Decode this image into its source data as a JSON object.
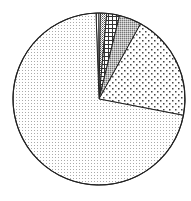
{
  "chart_data": {
    "type": "pie",
    "title": "",
    "legend": "none",
    "labels": [],
    "start_angle_deg": -2,
    "direction": "clockwise",
    "center": [
      99,
      99
    ],
    "radius": 86,
    "slices": [
      {
        "name": "slice-1",
        "pattern": "vertical-lines",
        "value": 0.8
      },
      {
        "name": "slice-2",
        "pattern": "checker-dots",
        "value": 1.2
      },
      {
        "name": "slice-3",
        "pattern": "grid",
        "value": 2.4
      },
      {
        "name": "slice-4",
        "pattern": "dense-stipple",
        "value": 4.2
      },
      {
        "name": "slice-5",
        "pattern": "sparse-dots",
        "value": 20.0
      },
      {
        "name": "slice-6",
        "pattern": "fine-dots",
        "value": 71.4
      }
    ]
  }
}
